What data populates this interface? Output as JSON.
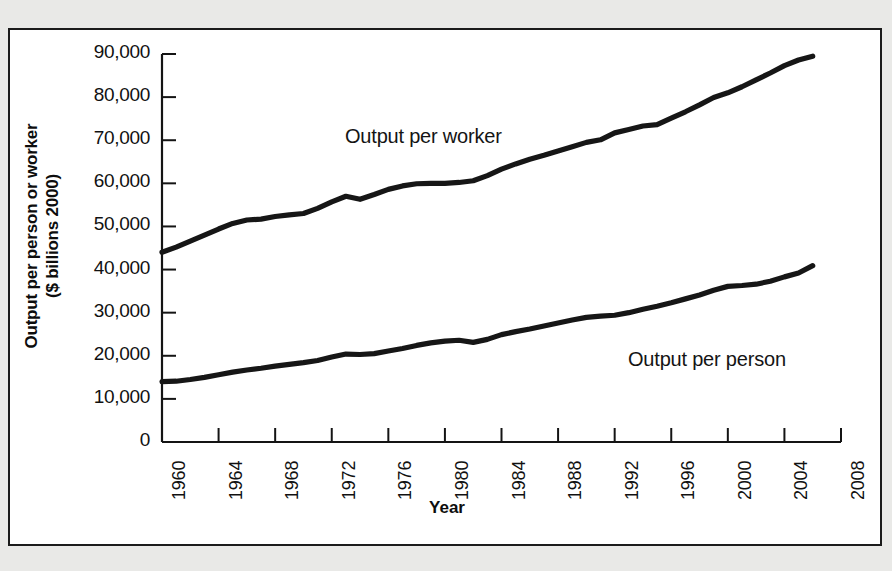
{
  "chart_data": {
    "type": "line",
    "title": "",
    "xlabel": "Year",
    "ylabel": "Output per person or worker ($ billions 2000)",
    "ylabel_line1": "Output per person or worker",
    "ylabel_line2": "($ billions 2000)",
    "xlim": [
      1960,
      2008
    ],
    "ylim": [
      0,
      90000
    ],
    "grid": false,
    "legend_position": "inline-annotation",
    "x_tick_labels": [
      "1960",
      "1964",
      "1968",
      "1972",
      "1976",
      "1980",
      "1984",
      "1988",
      "1992",
      "1996",
      "2000",
      "2004",
      "2008"
    ],
    "x_ticks": [
      1960,
      1964,
      1968,
      1972,
      1976,
      1980,
      1984,
      1988,
      1992,
      1996,
      2000,
      2004,
      2008
    ],
    "y_tick_labels": [
      "0",
      "10,000",
      "20,000",
      "30,000",
      "40,000",
      "50,000",
      "60,000",
      "70,000",
      "80,000",
      "90,000"
    ],
    "y_ticks": [
      0,
      10000,
      20000,
      30000,
      40000,
      50000,
      60000,
      70000,
      80000,
      90000
    ],
    "line_color": "#161616",
    "axis_color": "#141414",
    "x": [
      1960,
      1961,
      1962,
      1963,
      1964,
      1965,
      1966,
      1967,
      1968,
      1969,
      1970,
      1971,
      1972,
      1973,
      1974,
      1975,
      1976,
      1977,
      1978,
      1979,
      1980,
      1981,
      1982,
      1983,
      1984,
      1985,
      1986,
      1987,
      1988,
      1989,
      1990,
      1991,
      1992,
      1993,
      1994,
      1995,
      1996,
      1997,
      1998,
      1999,
      2000,
      2001,
      2002,
      2003,
      2004,
      2005,
      2006
    ],
    "series": [
      {
        "name": "Output per worker",
        "label": "Output per worker",
        "values": [
          44000,
          45200,
          46600,
          48000,
          49400,
          50700,
          51500,
          51700,
          52300,
          52700,
          53000,
          54200,
          55700,
          57000,
          56300,
          57400,
          58600,
          59400,
          59900,
          60000,
          60000,
          60200,
          60600,
          61800,
          63300,
          64500,
          65600,
          66500,
          67500,
          68500,
          69500,
          70100,
          71700,
          72500,
          73300,
          73600,
          75100,
          76600,
          78200,
          79900,
          81000,
          82400,
          84000,
          85600,
          87300,
          88600,
          89500
        ]
      },
      {
        "name": "Output per person",
        "label": "Output per person",
        "values": [
          14000,
          14100,
          14500,
          15000,
          15600,
          16200,
          16700,
          17100,
          17600,
          18000,
          18400,
          18900,
          19700,
          20400,
          20300,
          20500,
          21100,
          21700,
          22400,
          23000,
          23400,
          23600,
          23100,
          23800,
          24900,
          25600,
          26200,
          26900,
          27600,
          28300,
          28900,
          29200,
          29400,
          30000,
          30800,
          31500,
          32300,
          33200,
          34100,
          35200,
          36100,
          36300,
          36600,
          37300,
          38300,
          39200,
          40900
        ]
      }
    ]
  }
}
